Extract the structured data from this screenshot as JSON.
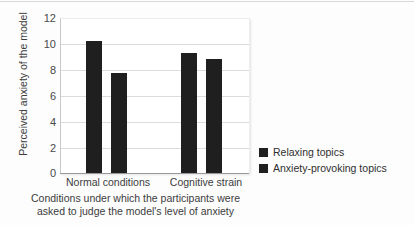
{
  "chart_data": {
    "type": "bar",
    "title": "",
    "categories": [
      "Normal conditions",
      "Cognitive strain"
    ],
    "series": [
      {
        "name": "Relaxing topics",
        "values": [
          10.3,
          9.4
        ],
        "color": "#201f1f"
      },
      {
        "name": "Anxiety-provoking topics",
        "values": [
          7.85,
          8.9
        ],
        "color": "#201f1f"
      }
    ],
    "ylabel": "Perceived anxiety of the model",
    "xlabel": "Conditions under which the participants were asked to judge the model's level of anxiety",
    "ylim": [
      0,
      12
    ],
    "yticks": [
      0,
      2,
      4,
      6,
      8,
      10,
      12
    ],
    "ytick_labels": [
      "0",
      "2",
      "4",
      "6",
      "8",
      "10",
      "12"
    ],
    "grid": true,
    "legend_position": "right"
  },
  "axes": {
    "y_title": "Perceived anxiety of the model",
    "tick_labels": {
      "y": [
        "12",
        "10",
        "8",
        "6",
        "4",
        "2",
        "0"
      ],
      "x": [
        "Normal conditions",
        "Cognitive strain"
      ]
    }
  },
  "caption": {
    "line1": "Conditions under which the participants were",
    "line2": "asked to judge the model's level of anxiety"
  },
  "legend": {
    "items": [
      {
        "label": "Relaxing topics"
      },
      {
        "label": "Anxiety-provoking topics"
      }
    ]
  }
}
